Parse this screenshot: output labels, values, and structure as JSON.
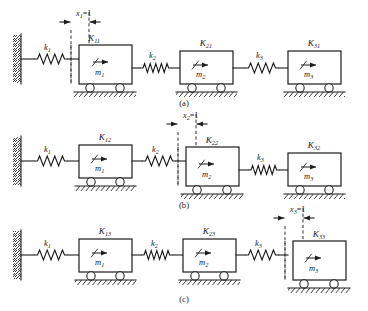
{
  "figure": {
    "type": "mechanical-schematic",
    "background_color": "#ffffff",
    "line_color": "#1c1c1c"
  },
  "panels": [
    {
      "id": "a",
      "label": "(a)",
      "displacement": {
        "symbol": "x",
        "subscript": "1",
        "equals": "=1",
        "full": "x1=1",
        "applied_to_mass": 1
      },
      "wall": {
        "present": true,
        "side": "left"
      },
      "springs": [
        {
          "label": "k",
          "subscript": "1",
          "full": "k1"
        },
        {
          "label": "k",
          "subscript": "2",
          "full": "k2"
        },
        {
          "label": "k",
          "subscript": "3",
          "full": "k3"
        }
      ],
      "masses": [
        {
          "mass_label": "m",
          "mass_subscript": "1",
          "mass_full": "m1",
          "force_label": "K",
          "force_subscript": "11",
          "force_full": "K11",
          "displaced": true
        },
        {
          "mass_label": "m",
          "mass_subscript": "2",
          "mass_full": "m2",
          "force_label": "K",
          "force_subscript": "21",
          "force_full": "K21",
          "displaced": false
        },
        {
          "mass_label": "m",
          "mass_subscript": "3",
          "mass_full": "m3",
          "force_label": "K",
          "force_subscript": "31",
          "force_full": "K31",
          "displaced": false
        }
      ]
    },
    {
      "id": "b",
      "label": "(b)",
      "displacement": {
        "symbol": "x",
        "subscript": "2",
        "equals": "=1",
        "full": "x2=1",
        "applied_to_mass": 2
      },
      "wall": {
        "present": true,
        "side": "left"
      },
      "springs": [
        {
          "label": "k",
          "subscript": "1",
          "full": "k1"
        },
        {
          "label": "k",
          "subscript": "2",
          "full": "k2"
        },
        {
          "label": "k",
          "subscript": "3",
          "full": "k3"
        }
      ],
      "masses": [
        {
          "mass_label": "m",
          "mass_subscript": "1",
          "mass_full": "m1",
          "force_label": "K",
          "force_subscript": "12",
          "force_full": "K12",
          "displaced": false
        },
        {
          "mass_label": "m",
          "mass_subscript": "2",
          "mass_full": "m2",
          "force_label": "K",
          "force_subscript": "22",
          "force_full": "K22",
          "displaced": true
        },
        {
          "mass_label": "m",
          "mass_subscript": "3",
          "mass_full": "m3",
          "force_label": "K",
          "force_subscript": "32",
          "force_full": "K32",
          "displaced": false
        }
      ]
    },
    {
      "id": "c",
      "label": "(c)",
      "displacement": {
        "symbol": "x",
        "subscript": "3",
        "equals": "=1",
        "full": "x3=1",
        "applied_to_mass": 3
      },
      "wall": {
        "present": true,
        "side": "left"
      },
      "springs": [
        {
          "label": "k",
          "subscript": "1",
          "full": "k1"
        },
        {
          "label": "k",
          "subscript": "2",
          "full": "k2"
        },
        {
          "label": "k",
          "subscript": "3",
          "full": "k3"
        }
      ],
      "masses": [
        {
          "mass_label": "m",
          "mass_subscript": "1",
          "mass_full": "m1",
          "force_label": "K",
          "force_subscript": "13",
          "force_full": "K13",
          "displaced": false
        },
        {
          "mass_label": "m",
          "mass_subscript": "2",
          "mass_full": "m2",
          "force_label": "K",
          "force_subscript": "23",
          "force_full": "K23",
          "displaced": false
        },
        {
          "mass_label": "m",
          "mass_subscript": "3",
          "mass_full": "m3",
          "force_label": "K",
          "force_subscript": "33",
          "force_full": "K33",
          "displaced": true
        }
      ]
    }
  ]
}
